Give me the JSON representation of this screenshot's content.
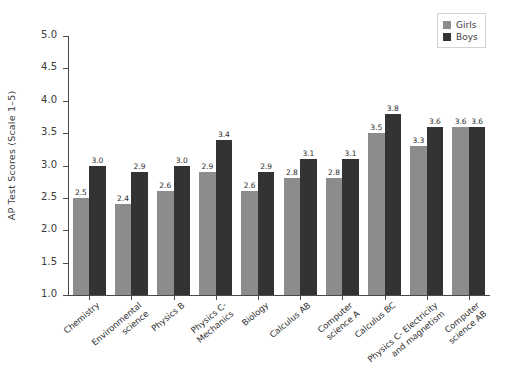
{
  "chart_data": {
    "type": "bar",
    "title": "",
    "xlabel": "",
    "ylabel": "AP Test Scores (Scale 1–5)",
    "ylim": [
      1.0,
      5.0
    ],
    "ytick_values": [
      5.0,
      4.5,
      4.0,
      3.5,
      3.0,
      2.5,
      2.0,
      1.5,
      1.0
    ],
    "ytick_labels": [
      "5.0",
      "4.5",
      "4.0",
      "3.5",
      "3.0",
      "2.5",
      "2.0",
      "1.5",
      "1.0"
    ],
    "grid": false,
    "legend_position": "upper right",
    "bar_value_labels": true,
    "categories": [
      "Chemistry",
      "Environmental\nscience",
      "Physics B",
      "Physics C-\nMechanics",
      "Biology",
      "Calculus AB",
      "Computer\nscience A",
      "Calculus BC",
      "Physics C- Electricity\nand magnetism",
      "Computer\nscience AB"
    ],
    "series": [
      {
        "name": "Girls",
        "color": "#8c8c8c",
        "values": [
          2.5,
          2.4,
          2.6,
          2.9,
          2.6,
          2.8,
          2.8,
          3.5,
          3.3,
          3.6
        ],
        "labels": [
          "2.5",
          "2.4",
          "2.6",
          "2.9",
          "2.6",
          "2.8",
          "2.8",
          "3.5",
          "3.3",
          "3.6"
        ]
      },
      {
        "name": "Boys",
        "color": "#333333",
        "values": [
          3.0,
          2.9,
          3.0,
          3.4,
          2.9,
          3.1,
          3.1,
          3.8,
          3.6,
          3.6
        ],
        "labels": [
          "3.0",
          "2.9",
          "3.0",
          "3.4",
          "2.9",
          "3.1",
          "3.1",
          "3.8",
          "3.6",
          "3.6"
        ]
      }
    ]
  },
  "legend": {
    "entries": [
      {
        "label": "Girls",
        "swatch": "girls"
      },
      {
        "label": "Boys",
        "swatch": "boys"
      }
    ]
  },
  "colors": {
    "girls": "#8c8c8c",
    "boys": "#333333",
    "axis": "#4a4a4a",
    "text": "#2e2e2e",
    "background": "#ffffff"
  }
}
